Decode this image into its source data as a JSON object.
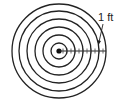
{
  "diagram": {
    "center": {
      "x": 59,
      "y": 51
    },
    "radii": [
      8,
      16,
      24,
      32,
      40,
      47
    ],
    "ring_count": 6,
    "ticks": [
      63,
      67,
      71,
      75,
      79,
      83,
      87,
      91,
      95,
      99,
      103
    ],
    "label": "1 ft",
    "stroke_color": "#222222",
    "background_color": "#ffffff"
  }
}
